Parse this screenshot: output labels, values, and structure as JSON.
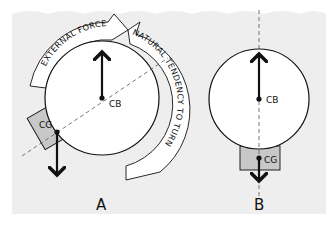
{
  "diagram": {
    "colors": {
      "background": "#eeeeee",
      "circle_fill": "#ffffff",
      "weight_fill": "#c8c8c8",
      "stroke": "#111111",
      "dashed_axis": "#555555"
    },
    "panel_a": {
      "label": "A",
      "center_of_buoyancy_label": "CB",
      "center_of_gravity_label": "CG",
      "external_force_label": "EXTERNAL FORCE",
      "natural_tendency_label": "NATURAL TENDENCY TO TURN"
    },
    "panel_b": {
      "label": "B",
      "center_of_buoyancy_label": "CB",
      "center_of_gravity_label": "CG"
    }
  }
}
